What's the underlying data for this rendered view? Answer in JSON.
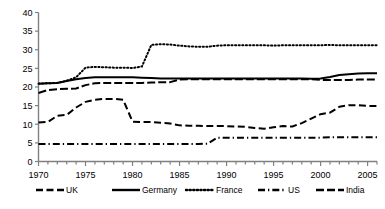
{
  "chart_data": {
    "type": "line",
    "title": "",
    "subtitle": "",
    "xlabel": "",
    "ylabel": "",
    "xlim": [
      1970,
      2006
    ],
    "ylim": [
      0,
      40
    ],
    "ytick_step": 5,
    "yticks": [
      "0",
      "5",
      "10",
      "15",
      "20",
      "25",
      "30",
      "35",
      "40"
    ],
    "xticks": [
      "1970",
      "1975",
      "1980",
      "1985",
      "1990",
      "1995",
      "2000",
      "2005"
    ],
    "minor_xticks_every": 1,
    "grid": false,
    "legend_position": "bottom",
    "x": [
      1970,
      1971,
      1972,
      1973,
      1974,
      1975,
      1976,
      1977,
      1978,
      1979,
      1980,
      1981,
      1982,
      1983,
      1984,
      1985,
      1986,
      1987,
      1988,
      1989,
      1990,
      1991,
      1992,
      1993,
      1994,
      1995,
      1996,
      1997,
      1998,
      1999,
      2000,
      2001,
      2002,
      2003,
      2004,
      2005,
      2006
    ],
    "series": [
      {
        "name": "UK",
        "color": "#000000",
        "dash": "dashed",
        "values": [
          10.5,
          10.6,
          12.3,
          12.5,
          14.5,
          16.0,
          16.6,
          16.8,
          16.8,
          16.6,
          10.7,
          10.6,
          10.6,
          10.4,
          10.2,
          9.7,
          9.6,
          9.6,
          9.5,
          9.5,
          9.5,
          9.4,
          9.3,
          9.0,
          8.8,
          9.2,
          9.5,
          9.4,
          10.3,
          11.5,
          12.7,
          13.1,
          14.7,
          15.1,
          15.1,
          14.9,
          14.9
        ]
      },
      {
        "name": "Germany",
        "color": "#000000",
        "dash": "solid",
        "values": [
          20.9,
          21.0,
          21.1,
          21.6,
          22.1,
          22.4,
          22.6,
          22.6,
          22.6,
          22.6,
          22.6,
          22.5,
          22.4,
          22.3,
          22.3,
          22.3,
          22.3,
          22.3,
          22.3,
          22.3,
          22.3,
          22.3,
          22.3,
          22.3,
          22.3,
          22.3,
          22.3,
          22.3,
          22.3,
          22.2,
          22.3,
          22.7,
          23.2,
          23.4,
          23.6,
          23.7,
          23.7
        ]
      },
      {
        "name": "France",
        "color": "#000000",
        "dash": "dotted",
        "values": [
          20.9,
          21.0,
          21.1,
          21.7,
          22.6,
          25.2,
          25.4,
          25.3,
          25.2,
          25.2,
          25.1,
          25.5,
          31.3,
          31.5,
          31.4,
          31.1,
          30.9,
          30.8,
          30.8,
          31.1,
          31.2,
          31.2,
          31.2,
          31.2,
          31.2,
          31.1,
          31.2,
          31.2,
          31.2,
          31.2,
          31.2,
          31.3,
          31.2,
          31.2,
          31.2,
          31.2,
          31.2
        ]
      },
      {
        "name": "US",
        "color": "#000000",
        "dash": "dashdot",
        "values": [
          4.7,
          4.7,
          4.7,
          4.7,
          4.7,
          4.7,
          4.7,
          4.7,
          4.7,
          4.7,
          4.7,
          4.7,
          4.7,
          4.7,
          4.7,
          4.7,
          4.7,
          4.7,
          4.8,
          6.4,
          6.4,
          6.4,
          6.4,
          6.4,
          6.4,
          6.4,
          6.4,
          6.4,
          6.4,
          6.4,
          6.4,
          6.5,
          6.5,
          6.5,
          6.5,
          6.5,
          6.5
        ]
      },
      {
        "name": "India",
        "color": "#000000",
        "dash": "longdash",
        "values": [
          18.4,
          19.2,
          19.4,
          19.5,
          19.6,
          20.5,
          21.0,
          21.1,
          21.1,
          21.1,
          21.1,
          21.1,
          21.2,
          21.3,
          21.3,
          22.0,
          22.1,
          22.1,
          22.1,
          22.1,
          22.1,
          22.1,
          22.1,
          22.1,
          22.1,
          22.1,
          22.1,
          22.1,
          22.1,
          22.1,
          21.9,
          21.9,
          21.9,
          21.9,
          22.0,
          22.0,
          22.0
        ]
      }
    ]
  },
  "legend": {
    "items": [
      {
        "label": "UK",
        "key": "uk"
      },
      {
        "label": "Germany",
        "key": "germany"
      },
      {
        "label": "France",
        "key": "france"
      },
      {
        "label": "US",
        "key": "us"
      },
      {
        "label": "India",
        "key": "india"
      }
    ]
  }
}
